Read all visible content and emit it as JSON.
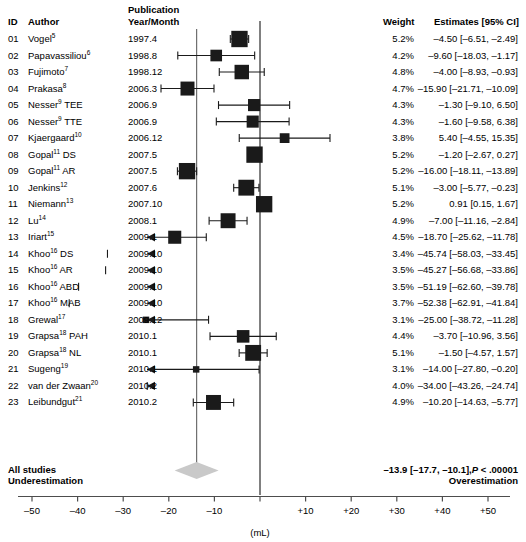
{
  "headers": {
    "id": "ID",
    "author": "Author",
    "publication_line1": "Publication",
    "publication_line2": "Year/Month",
    "weight": "Weight",
    "estimates": "Estimates [95% CI]"
  },
  "axis": {
    "unit_label": "(mL)",
    "ticks": [
      "–50",
      "–40",
      "–30",
      "–20",
      "–10",
      "",
      "+10",
      "+20",
      "+30",
      "+40",
      "+50"
    ],
    "tick_values": [
      -50,
      -40,
      -30,
      -20,
      -10,
      0,
      10,
      20,
      30,
      40,
      50
    ],
    "xmin": -57,
    "xmax": 58
  },
  "summary": {
    "label_line1": "All studies",
    "label_line2": "Underestimation",
    "right_line1_estimate": "–13.9 [–17.7, –10.1],",
    "right_line1_p_italic": "P",
    "right_line1_p_rest": " < .00001",
    "right_line2": "Overestimation",
    "pooled": -13.9,
    "ci_low": -17.7,
    "ci_high": -10.1,
    "p_text": "P < .00001"
  },
  "colors": {
    "marker": "#1a1a1a",
    "diamond": "#c9c9c9",
    "axis": "#4d4d4d",
    "text": "#000000"
  },
  "chart_data": {
    "type": "forest",
    "title": "",
    "xlabel": "(mL)",
    "ylabel": "",
    "xlim": [
      -57,
      58
    ],
    "grid": false,
    "legend": "none",
    "zero_line": 0,
    "pooled_line": -13.9,
    "columns": [
      "ID",
      "Author",
      "Publication Year/Month",
      "Weight",
      "Estimates [95% CI]"
    ],
    "rows": [
      {
        "id": "01",
        "author": "Vogel",
        "ref": "5",
        "year": "1997.4",
        "weight": "5.2%",
        "weight_val": 5.2,
        "estimate": "–4.50 [–6.51, –2.49]",
        "est": -4.5,
        "lo": -6.51,
        "hi": -2.49,
        "arrow": false
      },
      {
        "id": "02",
        "author": "Papavassiliou",
        "ref": "6",
        "year": "1998.8",
        "weight": "4.2%",
        "weight_val": 4.2,
        "estimate": "–9.60 [–18.03, –1.17]",
        "est": -9.6,
        "lo": -18.03,
        "hi": -1.17,
        "arrow": false
      },
      {
        "id": "03",
        "author": "Fujimoto",
        "ref": "7",
        "year": "1998.12",
        "weight": "4.8%",
        "weight_val": 4.8,
        "estimate": "–4.00 [–8.93, –0.93]",
        "est": -4.0,
        "lo": -8.93,
        "hi": 0.93,
        "arrow": false
      },
      {
        "id": "04",
        "author": "Prakasa",
        "ref": "8",
        "year": "2006.3",
        "weight": "4.7%",
        "weight_val": 4.7,
        "estimate": "–15.90 [–21.71, –10.09]",
        "est": -15.9,
        "lo": -21.71,
        "hi": -10.09,
        "arrow": false
      },
      {
        "id": "05",
        "author": "Nesser",
        "ref": "9",
        "suffix": " TEE",
        "year": "2006.9",
        "weight": "4.3%",
        "weight_val": 4.3,
        "estimate": "–1.30 [–9.10, 6.50]",
        "est": -1.3,
        "lo": -9.1,
        "hi": 6.5,
        "arrow": false
      },
      {
        "id": "06",
        "author": "Nesser",
        "ref": "9",
        "suffix": " TTE",
        "year": "2006.9",
        "weight": "4.3%",
        "weight_val": 4.3,
        "estimate": "–1.60 [–9.58, 6.38]",
        "est": -1.6,
        "lo": -9.58,
        "hi": 6.38,
        "arrow": false
      },
      {
        "id": "07",
        "author": "Kjaergaard",
        "ref": "10",
        "year": "2006.12",
        "weight": "3.8%",
        "weight_val": 3.8,
        "estimate": "5.40 [–4.55, 15.35]",
        "est": 5.4,
        "lo": -4.55,
        "hi": 15.35,
        "arrow": false
      },
      {
        "id": "08",
        "author": "Gopal",
        "ref": "11",
        "suffix": " DS",
        "year": "2007.5",
        "weight": "5.2%",
        "weight_val": 5.2,
        "estimate": "–1.20 [–2.67, 0.27]",
        "est": -1.2,
        "lo": -2.67,
        "hi": 0.27,
        "arrow": false
      },
      {
        "id": "09",
        "author": "Gopal",
        "ref": "11",
        "suffix": " AR",
        "year": "2007.5",
        "weight": "5.2%",
        "weight_val": 5.2,
        "estimate": "–16.00 [–18.11, –13.89]",
        "est": -16.0,
        "lo": -18.11,
        "hi": -13.89,
        "arrow": false
      },
      {
        "id": "10",
        "author": "Jenkins",
        "ref": "12",
        "year": "2007.6",
        "weight": "5.1%",
        "weight_val": 5.1,
        "estimate": "–3.00 [–5.77, –0.23]",
        "est": -3.0,
        "lo": -5.77,
        "hi": -0.23,
        "arrow": false
      },
      {
        "id": "11",
        "author": "Niemann",
        "ref": "13",
        "year": "2007.10",
        "weight": "5.2%",
        "weight_val": 5.2,
        "estimate": "0.91 [0.15, 1.67]",
        "est": 0.91,
        "lo": 0.15,
        "hi": 1.67,
        "arrow": false
      },
      {
        "id": "12",
        "author": "Lu",
        "ref": "14",
        "year": "2008.1",
        "weight": "4.9%",
        "weight_val": 4.9,
        "estimate": "–7.00 [–11.16, –2.84]",
        "est": -7.0,
        "lo": -11.16,
        "hi": -2.84,
        "arrow": false
      },
      {
        "id": "13",
        "author": "Iriart",
        "ref": "15",
        "year": "2009.1",
        "weight": "4.5%",
        "weight_val": 4.5,
        "estimate": "–18.70 [–25.62, –11.78]",
        "est": -18.7,
        "lo": -25.62,
        "hi": -11.78,
        "arrow": true
      },
      {
        "id": "14",
        "author": "Khoo",
        "ref": "16",
        "suffix": " DS",
        "year": "2009.10",
        "weight": "3.4%",
        "weight_val": 3.4,
        "estimate": "–45.74 [–58.03, –33.45]",
        "est": -45.74,
        "lo": -58.03,
        "hi": -33.45,
        "arrow": true,
        "offscale": true
      },
      {
        "id": "15",
        "author": "Khoo",
        "ref": "16",
        "suffix": " AR",
        "year": "2009.10",
        "weight": "3.5%",
        "weight_val": 3.5,
        "estimate": "–45.27 [–56.68, –33.86]",
        "est": -45.27,
        "lo": -56.68,
        "hi": -33.86,
        "arrow": true,
        "offscale": true
      },
      {
        "id": "16",
        "author": "Khoo",
        "ref": "16",
        "suffix": " ABD",
        "year": "2009.10",
        "weight": "3.5%",
        "weight_val": 3.5,
        "estimate": "–51.19 [–62.60, –39.78]",
        "est": -51.19,
        "lo": -62.6,
        "hi": -39.78,
        "arrow": true,
        "offscale": true
      },
      {
        "id": "17",
        "author": "Khoo",
        "ref": "16",
        "suffix": " MAB",
        "year": "2009.10",
        "weight": "3.7%",
        "weight_val": 3.7,
        "estimate": "–52.38 [–62.91, –41.84]",
        "est": -52.38,
        "lo": -62.91,
        "hi": -41.84,
        "arrow": true,
        "offscale": true
      },
      {
        "id": "18",
        "author": "Grewal",
        "ref": "17",
        "year": "2009.12",
        "weight": "3.1%",
        "weight_val": 3.1,
        "estimate": "–25.00 [–38.72, –11.28]",
        "est": -25.0,
        "lo": -38.72,
        "hi": -11.28,
        "arrow": true
      },
      {
        "id": "19",
        "author": "Grapsa",
        "ref": "18",
        "suffix": " PAH",
        "year": "2010.1",
        "weight": "4.4%",
        "weight_val": 4.4,
        "estimate": "–3.70 [–10.96, 3.56]",
        "est": -3.7,
        "lo": -10.96,
        "hi": 3.56,
        "arrow": false
      },
      {
        "id": "20",
        "author": "Grapsa",
        "ref": "18",
        "suffix": " NL",
        "year": "2010.1",
        "weight": "5.1%",
        "weight_val": 5.1,
        "estimate": "–1.50 [–4.57, 1.57]",
        "est": -1.5,
        "lo": -4.57,
        "hi": 1.57,
        "arrow": false
      },
      {
        "id": "21",
        "author": "Sugeng",
        "ref": "19",
        "year": "2010.1",
        "weight": "3.1%",
        "weight_val": 3.1,
        "estimate": "–14.00 [–27.80, –0.20]",
        "est": -14.0,
        "lo": -27.8,
        "hi": -0.2,
        "arrow": true
      },
      {
        "id": "22",
        "author": "van der Zwaan",
        "ref": "20",
        "year": "2010.2",
        "weight": "4.0%",
        "weight_val": 4.0,
        "estimate": "–34.00 [–43.26, –24.74]",
        "est": -34.0,
        "lo": -43.26,
        "hi": -24.74,
        "arrow": true,
        "offscale": true
      },
      {
        "id": "23",
        "author": "Leibundgut",
        "ref": "21",
        "year": "2010.2",
        "weight": "4.9%",
        "weight_val": 4.9,
        "estimate": "–10.20 [–14.63, –5.77]",
        "est": -10.2,
        "lo": -14.63,
        "hi": -5.77,
        "arrow": false
      }
    ]
  }
}
